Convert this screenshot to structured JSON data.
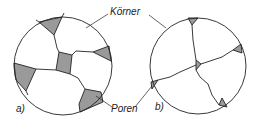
{
  "diagram": {
    "labels": {
      "grains": "Körner",
      "pores": "Poren",
      "panel_a": "a)",
      "panel_b": "b)"
    },
    "colors": {
      "outline": "#222222",
      "pore_fill": "#9a9a9a",
      "background": "#ffffff"
    },
    "panels": [
      {
        "id": "a",
        "description": "Microstructure with large pores between grains"
      },
      {
        "id": "b",
        "description": "Microstructure after sintering with small pores at triple points"
      }
    ]
  }
}
